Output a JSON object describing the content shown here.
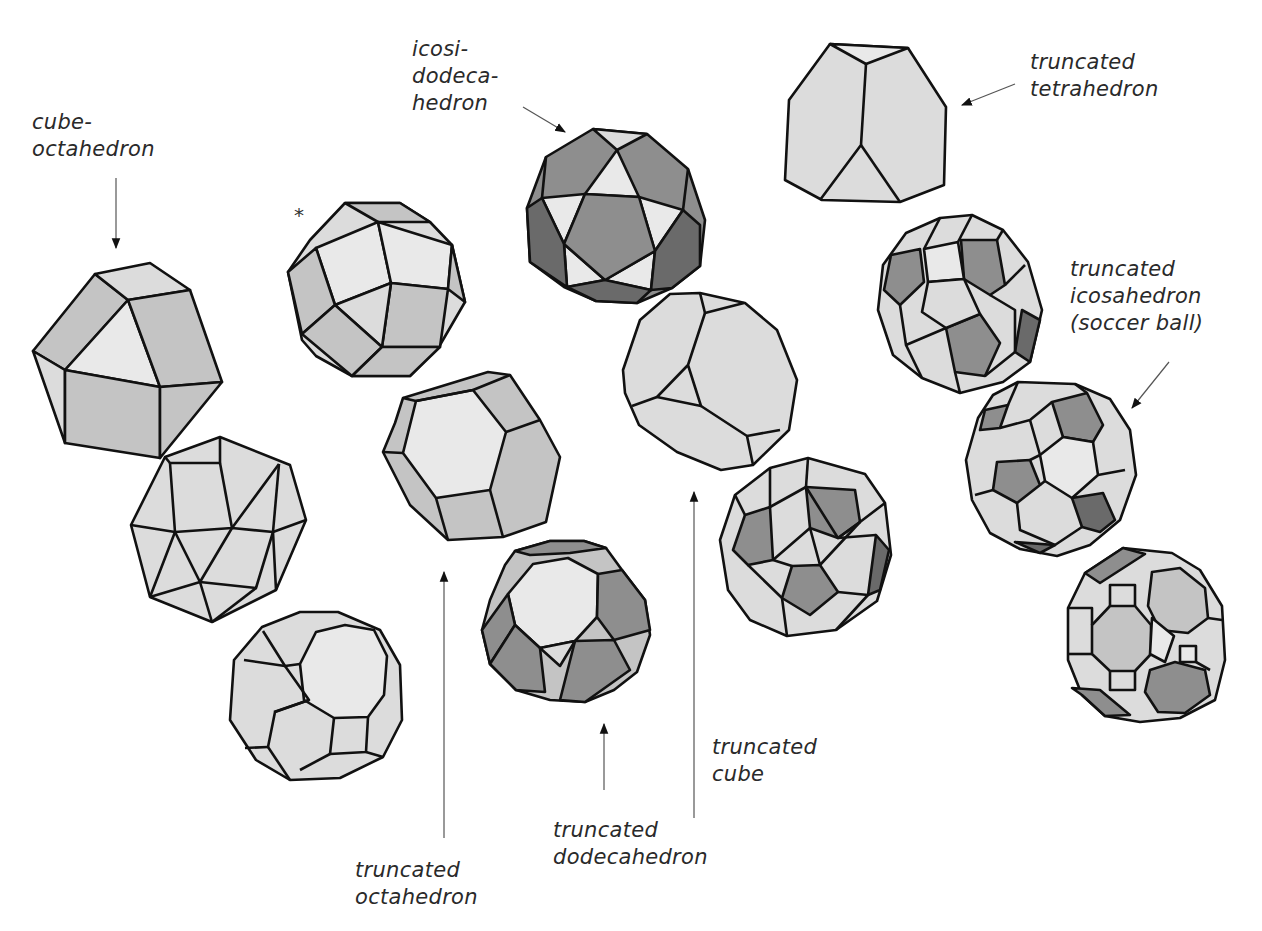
{
  "figure": {
    "colors": {
      "background": "#ffffff",
      "edge": "#111111",
      "face_light": "#dcdcdc",
      "face_mid": "#c4c4c4",
      "face_dark": "#8e8e8e",
      "label": "#2a2a2a"
    }
  },
  "labels": {
    "cuboctahedron": "cube-\noctahedron",
    "icosidodecahedron": "icosi-\ndodeca-\nhedron",
    "truncated_tetrahedron": "truncated\ntetrahedron",
    "truncated_icosahedron": "truncated\nicosahedron\n(soccer ball)",
    "truncated_octahedron": "truncated\noctahedron",
    "truncated_dodecahedron": "truncated\ndodecahedron",
    "truncated_cube": "truncated\ncube",
    "asterisk": "*"
  },
  "solids": [
    {
      "id": "cuboctahedron",
      "labeled": true
    },
    {
      "id": "snub-cube",
      "labeled": false
    },
    {
      "id": "truncated-cuboctahedron",
      "labeled": false
    },
    {
      "id": "rhombicuboctahedron",
      "labeled": false,
      "marker": "*"
    },
    {
      "id": "truncated-octahedron",
      "labeled": true
    },
    {
      "id": "truncated-dodecahedron",
      "labeled": true
    },
    {
      "id": "icosidodecahedron",
      "labeled": true
    },
    {
      "id": "truncated-cube",
      "labeled": true
    },
    {
      "id": "snub-dodecahedron",
      "labeled": false
    },
    {
      "id": "truncated-tetrahedron",
      "labeled": true
    },
    {
      "id": "rhombicosidodecahedron",
      "labeled": false
    },
    {
      "id": "truncated-icosahedron",
      "labeled": true
    },
    {
      "id": "truncated-icosidodecahedron",
      "labeled": false
    }
  ]
}
